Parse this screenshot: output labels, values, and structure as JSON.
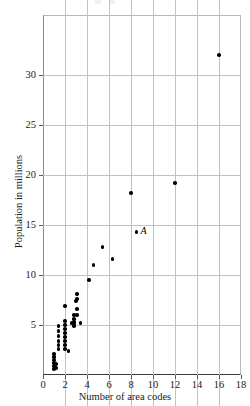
{
  "chart_data": {
    "type": "scatter",
    "title": "",
    "xlabel": "Number of area codes",
    "ylabel": "Population in millions",
    "xlim": [
      0,
      18
    ],
    "ylim": [
      0,
      36
    ],
    "xticks": [
      0,
      2,
      4,
      6,
      8,
      10,
      12,
      14,
      16,
      18
    ],
    "yticks": [
      5,
      10,
      15,
      20,
      25,
      30
    ],
    "xtick_labels": [
      "0",
      "2",
      "4",
      "6",
      "8",
      "10",
      "12",
      "14",
      "16",
      "18"
    ],
    "ytick_labels": [
      "5",
      "10",
      "15",
      "20",
      "25",
      "30"
    ],
    "grid": true,
    "legend": false,
    "marker": "filled-circle",
    "marker_color": "#000000",
    "points": [
      {
        "x": 1.0,
        "y": 0.6
      },
      {
        "x": 1.0,
        "y": 0.9
      },
      {
        "x": 1.0,
        "y": 1.2
      },
      {
        "x": 1.0,
        "y": 1.5
      },
      {
        "x": 1.0,
        "y": 1.8
      },
      {
        "x": 1.0,
        "y": 2.1
      },
      {
        "x": 1.2,
        "y": 0.7
      },
      {
        "x": 1.2,
        "y": 1.1
      },
      {
        "x": 1.4,
        "y": 2.6
      },
      {
        "x": 1.4,
        "y": 3.0
      },
      {
        "x": 1.4,
        "y": 3.4
      },
      {
        "x": 1.4,
        "y": 3.9
      },
      {
        "x": 1.4,
        "y": 4.4
      },
      {
        "x": 1.4,
        "y": 4.9
      },
      {
        "x": 2.0,
        "y": 2.6
      },
      {
        "x": 2.0,
        "y": 3.0
      },
      {
        "x": 2.0,
        "y": 3.4
      },
      {
        "x": 2.0,
        "y": 3.8
      },
      {
        "x": 2.0,
        "y": 4.2
      },
      {
        "x": 2.0,
        "y": 4.6
      },
      {
        "x": 2.0,
        "y": 5.0
      },
      {
        "x": 2.0,
        "y": 5.4
      },
      {
        "x": 2.0,
        "y": 6.9
      },
      {
        "x": 2.3,
        "y": 2.4
      },
      {
        "x": 2.6,
        "y": 5.2
      },
      {
        "x": 2.8,
        "y": 6.0
      },
      {
        "x": 2.8,
        "y": 5.6
      },
      {
        "x": 2.8,
        "y": 5.3
      },
      {
        "x": 2.8,
        "y": 5.1
      },
      {
        "x": 2.8,
        "y": 4.9
      },
      {
        "x": 3.0,
        "y": 7.4
      },
      {
        "x": 3.1,
        "y": 8.1
      },
      {
        "x": 3.1,
        "y": 7.6
      },
      {
        "x": 3.1,
        "y": 6.6
      },
      {
        "x": 3.1,
        "y": 6.0
      },
      {
        "x": 3.4,
        "y": 5.2
      },
      {
        "x": 4.2,
        "y": 9.5
      },
      {
        "x": 4.6,
        "y": 11.0
      },
      {
        "x": 5.4,
        "y": 12.8
      },
      {
        "x": 6.3,
        "y": 11.6
      },
      {
        "x": 8.0,
        "y": 18.2
      },
      {
        "x": 8.5,
        "y": 14.3,
        "label": "A"
      },
      {
        "x": 12.0,
        "y": 19.2
      },
      {
        "x": 16.0,
        "y": 32.0
      }
    ],
    "annotations": [
      {
        "text": "A",
        "x": 8.5,
        "y": 14.3,
        "style": "italic"
      }
    ]
  }
}
